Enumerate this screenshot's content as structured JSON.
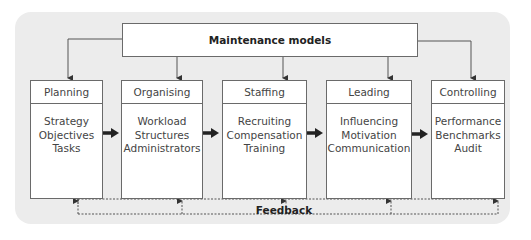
{
  "diagram": {
    "top_box": {
      "label": "Maintenance models"
    },
    "functions": [
      {
        "title": "Planning",
        "items": [
          "Strategy",
          "Objectives",
          "Tasks"
        ]
      },
      {
        "title": "Organising",
        "items": [
          "Workload",
          "Structures",
          "Administrators"
        ]
      },
      {
        "title": "Staffing",
        "items": [
          "Recruiting",
          "Compensation",
          "Training"
        ]
      },
      {
        "title": "Leading",
        "items": [
          "Influencing",
          "Motivation",
          "Communication"
        ]
      },
      {
        "title": "Controlling",
        "items": [
          "Performance",
          "Benchmarks",
          "Audit"
        ]
      }
    ],
    "feedback": {
      "label": "Feedback"
    },
    "colors": {
      "panel_background": "#ececec",
      "box_fill": "#ffffff",
      "box_border": "#6a6a6a",
      "arrow": "#222222"
    }
  }
}
